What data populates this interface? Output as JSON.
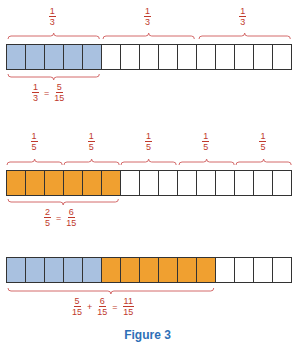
{
  "colors": {
    "blue": "#a9c1e0",
    "orange": "#f0a030",
    "brace": "#d46a6a",
    "text": "#c0392b",
    "caption": "#2e6fb7"
  },
  "cells_per_bar": 15,
  "bar1": {
    "top_labels": [
      {
        "num": "1",
        "den": "3"
      },
      {
        "num": "1",
        "den": "3"
      },
      {
        "num": "1",
        "den": "3"
      }
    ],
    "fills": [
      "blue",
      "blue",
      "blue",
      "blue",
      "blue",
      "",
      "",
      "",
      "",
      "",
      "",
      "",
      "",
      "",
      ""
    ],
    "equation": [
      {
        "num": "1",
        "den": "3"
      },
      "=",
      {
        "num": "5",
        "den": "15"
      }
    ]
  },
  "bar2": {
    "top_labels": [
      {
        "num": "1",
        "den": "5"
      },
      {
        "num": "1",
        "den": "5"
      },
      {
        "num": "1",
        "den": "5"
      },
      {
        "num": "1",
        "den": "5"
      },
      {
        "num": "1",
        "den": "5"
      }
    ],
    "fills": [
      "orange",
      "orange",
      "orange",
      "orange",
      "orange",
      "orange",
      "",
      "",
      "",
      "",
      "",
      "",
      "",
      "",
      ""
    ],
    "equation": [
      {
        "num": "2",
        "den": "5"
      },
      "=",
      {
        "num": "6",
        "den": "15"
      }
    ]
  },
  "bar3": {
    "fills": [
      "blue",
      "blue",
      "blue",
      "blue",
      "blue",
      "orange",
      "orange",
      "orange",
      "orange",
      "orange",
      "orange",
      "",
      "",
      "",
      ""
    ],
    "equation": [
      {
        "num": "5",
        "den": "15"
      },
      "+",
      {
        "num": "6",
        "den": "15"
      },
      "=",
      {
        "num": "11",
        "den": "15"
      }
    ]
  },
  "caption": "Figure 3"
}
